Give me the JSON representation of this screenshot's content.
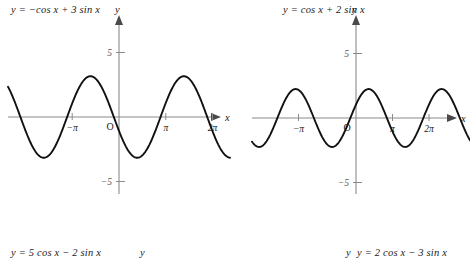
{
  "page": {
    "width": 470,
    "height": 265,
    "background": "#ffffff",
    "ink": "#111111",
    "axis_color": "#8a8a8a"
  },
  "labels": {
    "top_left_equation": "y  =  −cos x + 3 sin x",
    "top_left_axis_y": "y",
    "top_right_axis_y": "y",
    "top_right_equation": "y  =  cos x + 2 sin x",
    "bottom_left_equation": "y  =  5 cos x − 2 sin x",
    "bottom_left_axis_y": "y",
    "bottom_right_axis_y": "y",
    "bottom_right_equation": "y  =  2 cos x − 3 sin x"
  },
  "axes": {
    "x_label": "x",
    "y_label": "y",
    "origin_label": "O",
    "x_ticks": [
      "−π",
      "π",
      "2π"
    ],
    "y_ticks": [
      "5",
      "−5"
    ]
  },
  "chart_data": [
    {
      "id": "left-graph",
      "type": "line",
      "title": "y = −cos x + 3 sin x",
      "xlabel": "x",
      "ylabel": "y",
      "xlim": [
        -4.7,
        7.9
      ],
      "ylim": [
        -6.6,
        6.6
      ],
      "grid": false,
      "legend": "none",
      "xtick_values": [
        -3.14159,
        3.14159,
        6.28319
      ],
      "xtick_labels": [
        "−π",
        "π",
        "2π"
      ],
      "ytick_values": [
        5,
        -5
      ],
      "ytick_labels": [
        "5",
        "−5"
      ],
      "amplitude": 3.1623,
      "function": "-cos(x) + 3*sin(x)",
      "series": [
        {
          "name": "y = −cos x + 3 sin x",
          "x": [
            -4.7,
            -4.4,
            -4.1,
            -3.8,
            -3.5,
            -3.2,
            -2.9,
            -2.6,
            -2.3,
            -2.0,
            -1.7,
            -1.4,
            -1.1,
            -0.8,
            -0.5,
            -0.2,
            0.1,
            0.4,
            0.7,
            1.0,
            1.3,
            1.6,
            1.9,
            2.2,
            2.5,
            2.8,
            3.1,
            3.4,
            3.7,
            4.0,
            4.3,
            4.6,
            4.9,
            5.2,
            5.5,
            5.8,
            6.1,
            6.4,
            6.7,
            7.0,
            7.3,
            7.6,
            7.9
          ],
          "y": [
            -3.0,
            -2.6,
            -2.0,
            -1.1,
            -0.1,
            1.0,
            1.7,
            2.4,
            2.9,
            3.14,
            3.1,
            2.8,
            2.2,
            1.45,
            0.44,
            -0.62,
            -1.3,
            -2.09,
            -2.69,
            -3.06,
            -3.16,
            -2.92,
            -2.51,
            -1.82,
            -1.01,
            -0.11,
            0.84,
            1.73,
            2.47,
            2.92,
            3.13,
            3.0,
            2.64,
            1.97,
            1.19,
            0.28,
            -0.66,
            -1.58,
            -2.35,
            -2.89,
            -3.14,
            -3.11,
            -2.76
          ]
        }
      ]
    },
    {
      "id": "right-graph",
      "type": "line",
      "title": "y = cos x + 2 sin x",
      "xlabel": "x",
      "ylabel": "y",
      "xlim": [
        -4.7,
        7.9
      ],
      "ylim": [
        -6.6,
        6.6
      ],
      "grid": false,
      "legend": "none",
      "xtick_values": [
        -3.14159,
        3.14159,
        6.28319
      ],
      "xtick_labels": [
        "−π",
        "π",
        "2π"
      ],
      "ytick_values": [
        5,
        -5
      ],
      "ytick_labels": [
        "5",
        "−5"
      ],
      "amplitude": 2.2361,
      "function": "cos(x) + 2*sin(x)",
      "series": [
        {
          "name": "y = cos x + 2 sin x",
          "x": [
            -4.7,
            -4.4,
            -4.1,
            -3.8,
            -3.5,
            -3.2,
            -2.9,
            -2.6,
            -2.3,
            -2.0,
            -1.7,
            -1.4,
            -1.1,
            -0.8,
            -0.5,
            -0.2,
            0.1,
            0.4,
            0.7,
            1.0,
            1.3,
            1.6,
            1.9,
            2.2,
            2.5,
            2.8,
            3.1,
            3.4,
            3.7,
            4.0,
            4.3,
            4.6,
            4.9,
            5.2,
            5.5,
            5.8,
            6.1,
            6.4,
            6.7,
            7.0,
            7.3,
            7.6,
            7.9
          ],
          "y": [
            2.0,
            1.65,
            1.08,
            0.36,
            -0.4,
            -1.11,
            -1.65,
            -2.02,
            -2.16,
            -2.23,
            -2.11,
            -1.8,
            -1.33,
            -0.74,
            -0.08,
            0.58,
            1.19,
            1.7,
            2.05,
            2.22,
            2.19,
            1.97,
            1.57,
            1.03,
            0.4,
            -0.27,
            -0.91,
            -1.48,
            -1.91,
            -2.16,
            -2.22,
            -2.07,
            -1.73,
            -1.25,
            -0.64,
            0.03,
            0.69,
            1.29,
            1.76,
            2.07,
            2.19,
            2.12,
            1.85
          ]
        }
      ]
    }
  ]
}
